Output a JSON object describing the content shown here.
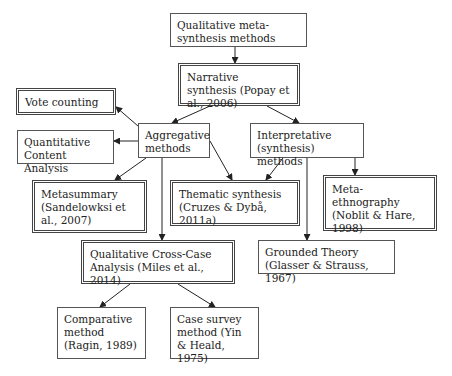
{
  "diagram": {
    "nodes": [
      {
        "id": "root",
        "label": "Qualitative meta-synthesis methods",
        "style": "single",
        "x": 170,
        "y": 13,
        "w": 137,
        "h": 34
      },
      {
        "id": "narrative",
        "label": "Narrative synthesis (Popay et al., 2006)",
        "style": "double",
        "x": 178,
        "y": 63,
        "w": 122,
        "h": 43
      },
      {
        "id": "vote",
        "label": "Vote counting",
        "style": "double",
        "x": 16,
        "y": 88,
        "w": 100,
        "h": 27
      },
      {
        "id": "aggregative",
        "label": "Aggregative methods",
        "style": "single",
        "x": 138,
        "y": 123,
        "w": 72,
        "h": 35
      },
      {
        "id": "qca",
        "label": "Quantitative Content Analysis",
        "style": "single",
        "x": 17,
        "y": 130,
        "w": 97,
        "h": 34
      },
      {
        "id": "interpretative",
        "label": "Interpretative (synthesis) methods",
        "style": "single",
        "x": 250,
        "y": 123,
        "w": 114,
        "h": 35
      },
      {
        "id": "metasummary",
        "label": "Metasummary (Sandelowksi et al., 2007)",
        "style": "double",
        "x": 32,
        "y": 180,
        "w": 115,
        "h": 53
      },
      {
        "id": "thematic",
        "label": "Thematic synthesis (Cruzes & Dybå, 2011a)",
        "style": "double",
        "x": 170,
        "y": 180,
        "w": 130,
        "h": 46
      },
      {
        "id": "metaethno",
        "label": "Meta-ethnography (Noblit & Hare, 1998)",
        "style": "double",
        "x": 323,
        "y": 175,
        "w": 114,
        "h": 56
      },
      {
        "id": "crosscase",
        "label": "Qualitative Cross-Case Analysis (Miles et al., 2014)",
        "style": "double",
        "x": 81,
        "y": 240,
        "w": 154,
        "h": 44
      },
      {
        "id": "grounded",
        "label": "Grounded Theory (Glasser & Strauss, 1967)",
        "style": "single",
        "x": 258,
        "y": 240,
        "w": 137,
        "h": 34
      },
      {
        "id": "comparative",
        "label": "Comparative method (Ragin, 1989)",
        "style": "single",
        "x": 57,
        "y": 307,
        "w": 89,
        "h": 52
      },
      {
        "id": "casesurvey",
        "label": "Case survey method (Yin & Heald, 1975)",
        "style": "single",
        "x": 170,
        "y": 307,
        "w": 89,
        "h": 52
      }
    ],
    "edges": [
      {
        "from": "root",
        "to": "narrative",
        "x1": 235,
        "y1": 47,
        "x2": 235,
        "y2": 63
      },
      {
        "from": "narrative",
        "to": "aggregative",
        "x1": 210,
        "y1": 106,
        "x2": 172,
        "y2": 123
      },
      {
        "from": "narrative",
        "to": "interpretative",
        "x1": 267,
        "y1": 106,
        "x2": 299,
        "y2": 123
      },
      {
        "from": "aggregative",
        "to": "vote",
        "x1": 138,
        "y1": 126,
        "x2": 116,
        "y2": 107
      },
      {
        "from": "aggregative",
        "to": "qca",
        "x1": 138,
        "y1": 141,
        "x2": 114,
        "y2": 141
      },
      {
        "from": "aggregative",
        "to": "metasummary",
        "x1": 146,
        "y1": 158,
        "x2": 115,
        "y2": 180
      },
      {
        "from": "aggregative",
        "to": "thematic",
        "x1": 210,
        "y1": 141,
        "x2": 232,
        "y2": 180
      },
      {
        "from": "aggregative",
        "to": "crosscase",
        "x1": 162,
        "y1": 158,
        "x2": 162,
        "y2": 240
      },
      {
        "from": "interpretative",
        "to": "thematic",
        "x1": 283,
        "y1": 158,
        "x2": 266,
        "y2": 180
      },
      {
        "from": "interpretative",
        "to": "grounded",
        "x1": 307,
        "y1": 158,
        "x2": 307,
        "y2": 240
      },
      {
        "from": "interpretative",
        "to": "metaethno",
        "x1": 355,
        "y1": 158,
        "x2": 355,
        "y2": 175
      },
      {
        "from": "crosscase",
        "to": "comparative",
        "x1": 130,
        "y1": 284,
        "x2": 100,
        "y2": 307
      },
      {
        "from": "crosscase",
        "to": "casesurvey",
        "x1": 178,
        "y1": 284,
        "x2": 215,
        "y2": 307
      }
    ]
  }
}
